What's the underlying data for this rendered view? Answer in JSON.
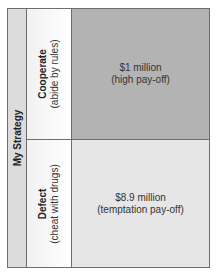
{
  "axis_label": "My Strategy",
  "rows": [
    {
      "strategy": "Cooperate",
      "description": "(abide by rules)",
      "payoff_amount": "$1 million",
      "payoff_type": "(high pay-off)",
      "cell_color": "#b3b3b3"
    },
    {
      "strategy": "Defect",
      "description": "(cheat with drugs)",
      "payoff_amount": "$8.9 million",
      "payoff_type": "(temptation pay-off)",
      "cell_color": "#e6e6e6"
    }
  ]
}
